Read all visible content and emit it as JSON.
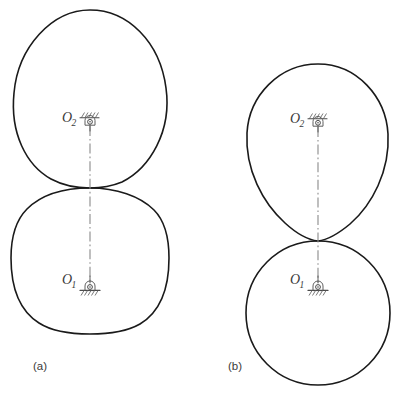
{
  "figure": {
    "background_color": "#ffffff",
    "outline_color": "#1a1a1a",
    "centerline_color": "#8a8a8a",
    "pivot_color": "#4a4a4a",
    "width": 408,
    "height": 395
  },
  "panels": [
    {
      "id": "a",
      "caption": "(a)",
      "caption_x": 33,
      "caption_y": 370,
      "center_x": 90,
      "upper_body": {
        "name": "upper-cam-a",
        "shape": "egg",
        "top_y": 10,
        "bottom_y": 188,
        "left_x": 14,
        "right_x": 168,
        "widest_y": 95
      },
      "lower_body": {
        "name": "lower-cam-a",
        "shape": "rounded-square",
        "top_y": 188,
        "bottom_y": 333,
        "left_x": 12,
        "right_x": 168
      },
      "pivots": [
        {
          "name": "pivot-o2",
          "label": "O",
          "subscript": "2",
          "type": "fixed-pin-overhead",
          "x": 90,
          "y": 124,
          "label_x": 62,
          "label_y": 122
        },
        {
          "name": "pivot-o1",
          "label": "O",
          "subscript": "1",
          "type": "fixed-pin-ground",
          "x": 90,
          "y": 285,
          "label_x": 62,
          "label_y": 284
        }
      ],
      "centerline": {
        "x": 90,
        "top_y": 126,
        "bottom_y": 287
      }
    },
    {
      "id": "b",
      "caption": "(b)",
      "caption_x": 228,
      "caption_y": 370,
      "center_x": 318,
      "upper_body": {
        "name": "upper-cam-b",
        "shape": "egg",
        "top_y": 64,
        "bottom_y": 241,
        "left_x": 247,
        "right_x": 388,
        "widest_y": 135
      },
      "lower_body": {
        "name": "lower-cam-b",
        "shape": "circle",
        "top_y": 241,
        "bottom_y": 385,
        "left_x": 246,
        "right_x": 390
      },
      "pivots": [
        {
          "name": "pivot-o2",
          "label": "O",
          "subscript": "2",
          "type": "fixed-pin-overhead",
          "x": 318,
          "y": 125,
          "label_x": 290,
          "label_y": 123
        },
        {
          "name": "pivot-o1",
          "label": "O",
          "subscript": "1",
          "type": "fixed-pin-ground",
          "x": 318,
          "y": 285,
          "label_x": 290,
          "label_y": 284
        }
      ],
      "centerline": {
        "x": 318,
        "top_y": 127,
        "bottom_y": 287
      }
    }
  ]
}
